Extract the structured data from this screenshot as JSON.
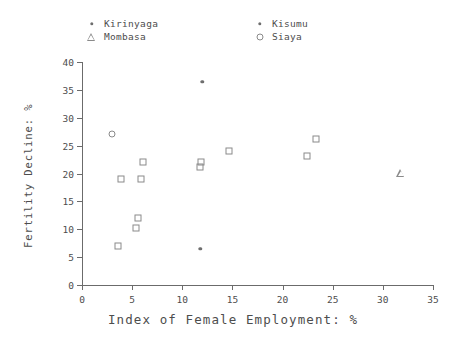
{
  "chart_data": {
    "type": "scatter",
    "title": "",
    "xlabel": "Index of Female Employment: %",
    "ylabel": "Fertility Decline: %",
    "xlim": [
      0,
      35
    ],
    "ylim": [
      0,
      40
    ],
    "xticks": [
      0,
      5,
      10,
      15,
      20,
      25,
      30,
      35
    ],
    "yticks": [
      0,
      5,
      10,
      15,
      20,
      25,
      30,
      35,
      40
    ],
    "grid": false,
    "legend_position": "top",
    "legend": [
      {
        "name": "Kirinyaga",
        "marker": "dot"
      },
      {
        "name": "Kisumu",
        "marker": "dot"
      },
      {
        "name": "Mombasa",
        "marker": "triangle"
      },
      {
        "name": "Siaya",
        "marker": "circle"
      }
    ],
    "series": [
      {
        "name": "Districts",
        "marker": "square",
        "points": [
          {
            "x": 3.6,
            "y": 7.0
          },
          {
            "x": 3.9,
            "y": 19.0
          },
          {
            "x": 5.4,
            "y": 10.2
          },
          {
            "x": 5.6,
            "y": 12.1
          },
          {
            "x": 5.9,
            "y": 19.1
          },
          {
            "x": 6.1,
            "y": 22.0
          },
          {
            "x": 11.8,
            "y": 21.2
          },
          {
            "x": 11.9,
            "y": 22.1
          },
          {
            "x": 14.7,
            "y": 24.0
          },
          {
            "x": 22.4,
            "y": 23.1
          },
          {
            "x": 23.3,
            "y": 26.1
          }
        ]
      },
      {
        "name": "Siaya",
        "marker": "circle",
        "points": [
          {
            "x": 3.0,
            "y": 27.0
          }
        ]
      },
      {
        "name": "Kisumu",
        "marker": "dot",
        "points": [
          {
            "x": 12.0,
            "y": 36.4
          },
          {
            "x": 11.8,
            "y": 6.5
          }
        ]
      },
      {
        "name": "Mombasa",
        "marker": "triangle",
        "points": [
          {
            "x": 31.8,
            "y": 20.1
          }
        ]
      }
    ]
  },
  "legend_items": [
    {
      "label": "Kirinyaga",
      "marker": "dot",
      "col": 0,
      "row": 0
    },
    {
      "label": "Mombasa",
      "marker": "triangle",
      "col": 0,
      "row": 1
    },
    {
      "label": "Kisumu",
      "marker": "dot",
      "col": 1,
      "row": 0
    },
    {
      "label": "Siaya",
      "marker": "circle",
      "col": 1,
      "row": 1
    }
  ],
  "colors": {
    "axis": "#6b6b6b",
    "marker": "#8a8a8a",
    "text": "#4d4d4d",
    "background": "#ffffff"
  }
}
